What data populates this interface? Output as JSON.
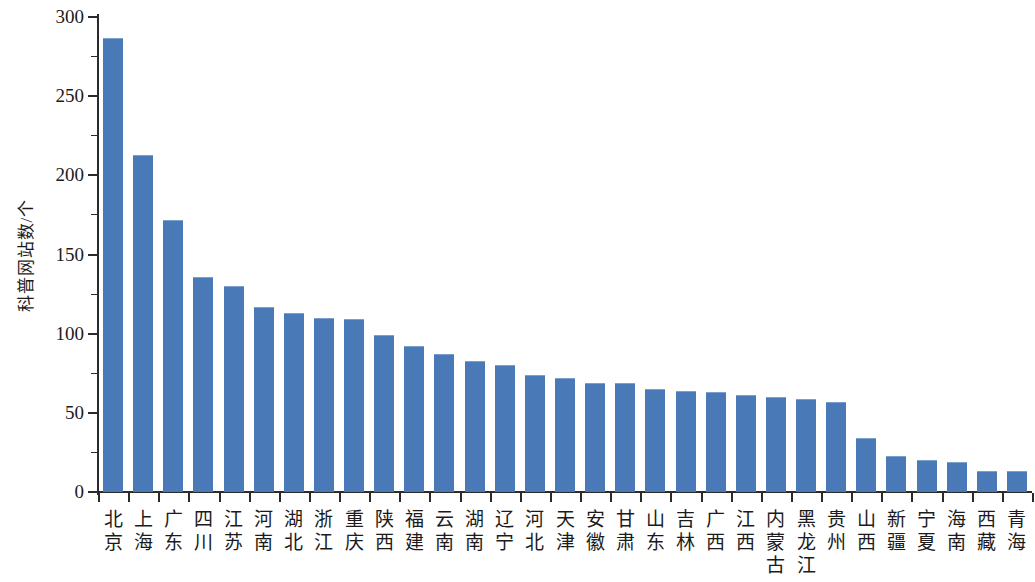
{
  "chart_data": {
    "type": "bar",
    "title": "",
    "xlabel": "",
    "ylabel": "科普网站数/个",
    "ylim": [
      0,
      300
    ],
    "ytick_labels": [
      "300",
      "250",
      "200",
      "150",
      "100",
      "50",
      "0"
    ],
    "ytick_values": [
      300,
      250,
      200,
      150,
      100,
      50,
      0
    ],
    "grid": false,
    "legend": "none",
    "bar_color": "#4a79b8",
    "axis_color": "#2b2b2b",
    "categories": [
      "北京",
      "上海",
      "广东",
      "四川",
      "江苏",
      "河南",
      "湖北",
      "浙江",
      "重庆",
      "陕西",
      "福建",
      "云南",
      "湖南",
      "辽宁",
      "河北",
      "天津",
      "安徽",
      "甘肃",
      "山东",
      "吉林",
      "广西",
      "江西",
      "内蒙古",
      "黑龙江",
      "贵州",
      "山西",
      "新疆",
      "宁夏",
      "海南",
      "西藏",
      "青海"
    ],
    "values": [
      287,
      213,
      172,
      136,
      130,
      117,
      113,
      110,
      109,
      99,
      92,
      87,
      83,
      80,
      74,
      72,
      69,
      69,
      65,
      64,
      63,
      61,
      60,
      59,
      57,
      34,
      23,
      20,
      19,
      13,
      13
    ]
  }
}
